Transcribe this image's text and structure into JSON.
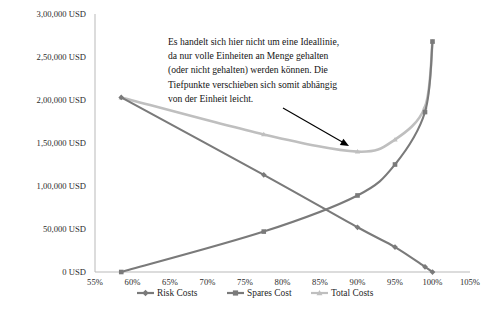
{
  "chart_data": {
    "type": "line",
    "title": "",
    "subtitle": "",
    "xlabel": "",
    "ylabel": "",
    "xlim": [
      55,
      105
    ],
    "ylim": [
      0,
      300000
    ],
    "grid": false,
    "legend_position": "bottom",
    "x_tick_labels": [
      "55%",
      "60%",
      "65%",
      "70%",
      "75%",
      "80%",
      "85%",
      "90%",
      "95%",
      "100%",
      "105%"
    ],
    "x_tick_values": [
      55,
      60,
      65,
      70,
      75,
      80,
      85,
      90,
      95,
      100,
      105
    ],
    "y_tick_labels": [
      "0 USD",
      "50,000 USD",
      "1,00,000 USD",
      "1,50,000 USD",
      "2,00,000 USD",
      "2,50,000 USD",
      "3,00,000 USD"
    ],
    "y_tick_values": [
      0,
      50000,
      100000,
      150000,
      200000,
      250000,
      300000
    ],
    "series": [
      {
        "name": "Risk Costs",
        "color": "#7a7a7a",
        "marker": "diamond",
        "x": [
          58.5,
          77.5,
          90.0,
          95.0,
          99.0,
          100.0
        ],
        "values": [
          203000,
          113000,
          52000,
          29000,
          6000,
          0
        ]
      },
      {
        "name": "Spares Cost",
        "color": "#7a7a7a",
        "marker": "square",
        "x": [
          58.5,
          77.5,
          90.0,
          95.0,
          99.0,
          100.0
        ],
        "values": [
          0,
          47000,
          89000,
          125000,
          186000,
          268000
        ]
      },
      {
        "name": "Total Costs",
        "color": "#bfbfbf",
        "marker": "triangle",
        "x": [
          58.5,
          77.5,
          90.0,
          95.0,
          99.0,
          100.0
        ],
        "values": [
          203000,
          160000,
          140000,
          154000,
          192000,
          268000
        ]
      }
    ],
    "annotations": [
      {
        "name": "ideallinie-note",
        "lines": [
          "Es handelt sich hier nicht um eine Ideallinie,",
          "da nur volle Einheiten an Menge gehalten",
          "(oder nicht gehalten) werden können. Die",
          "Tiefpunkte verschieben sich somit abhängig",
          "von der Einheit leicht."
        ],
        "arrow_from": [
          283,
          108
        ],
        "arrow_to": [
          349,
          146
        ]
      }
    ]
  },
  "legend": {
    "items": [
      {
        "label": "Risk Costs",
        "marker": "diamond",
        "color": "#7a7a7a"
      },
      {
        "label": "Spares Cost",
        "marker": "square",
        "color": "#7a7a7a"
      },
      {
        "label": "Total Costs",
        "marker": "triangle",
        "color": "#bfbfbf"
      }
    ]
  }
}
